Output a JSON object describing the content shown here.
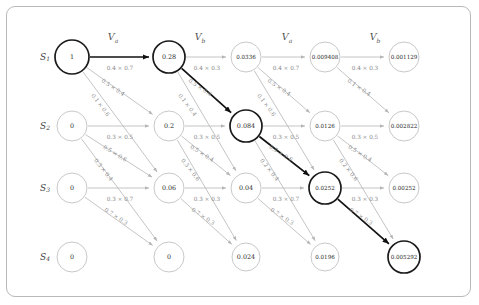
{
  "diagram": {
    "geometry": {
      "col_x": [
        72,
        169,
        246,
        325,
        404,
        443
      ],
      "row_y": [
        57,
        126,
        188,
        257
      ],
      "radius_big": 17,
      "radius": 15,
      "radius_small": 13
    },
    "state_labels": [
      {
        "base": "S",
        "sub": "1",
        "x": 45,
        "y": 57
      },
      {
        "base": "S",
        "sub": "2",
        "x": 45,
        "y": 126
      },
      {
        "base": "S",
        "sub": "3",
        "x": 45,
        "y": 188
      },
      {
        "base": "S",
        "sub": "4",
        "x": 45,
        "y": 257
      }
    ],
    "column_labels": [
      {
        "base": "V",
        "sub": "a",
        "x": 113,
        "y": 40
      },
      {
        "base": "V",
        "sub": "b",
        "x": 200,
        "y": 40
      },
      {
        "base": "V",
        "sub": "a",
        "x": 287,
        "y": 40
      },
      {
        "base": "V",
        "sub": "b",
        "x": 375,
        "y": 40
      }
    ],
    "nodes": [
      {
        "id": "n00",
        "col": 0,
        "row": 0,
        "value": "1",
        "highlight": true,
        "r": 17
      },
      {
        "id": "n01",
        "col": 0,
        "row": 1,
        "value": "0",
        "highlight": false,
        "r": 15
      },
      {
        "id": "n02",
        "col": 0,
        "row": 2,
        "value": "0",
        "highlight": false,
        "r": 15
      },
      {
        "id": "n03",
        "col": 0,
        "row": 3,
        "value": "0",
        "highlight": false,
        "r": 15
      },
      {
        "id": "n10",
        "col": 1,
        "row": 0,
        "value": "0.28",
        "highlight": true,
        "r": 16
      },
      {
        "id": "n11",
        "col": 1,
        "row": 1,
        "value": "0.2",
        "highlight": false,
        "r": 15
      },
      {
        "id": "n12",
        "col": 1,
        "row": 2,
        "value": "0.06",
        "highlight": false,
        "r": 15
      },
      {
        "id": "n13",
        "col": 1,
        "row": 3,
        "value": "0",
        "highlight": false,
        "r": 15
      },
      {
        "id": "n20",
        "col": 2,
        "row": 0,
        "value": "0.0336",
        "highlight": false,
        "r": 15
      },
      {
        "id": "n21",
        "col": 2,
        "row": 1,
        "value": "0.084",
        "highlight": true,
        "r": 16
      },
      {
        "id": "n22",
        "col": 2,
        "row": 2,
        "value": "0.04",
        "highlight": false,
        "r": 15
      },
      {
        "id": "n23",
        "col": 2,
        "row": 3,
        "value": "0.024",
        "highlight": false,
        "r": 14
      },
      {
        "id": "n30",
        "col": 3,
        "row": 0,
        "value": "0.009408",
        "highlight": false,
        "r": 15
      },
      {
        "id": "n31",
        "col": 3,
        "row": 1,
        "value": "0.0126",
        "highlight": false,
        "r": 15
      },
      {
        "id": "n32",
        "col": 3,
        "row": 2,
        "value": "0.0252",
        "highlight": true,
        "r": 16
      },
      {
        "id": "n33",
        "col": 3,
        "row": 3,
        "value": "0.0196",
        "highlight": false,
        "r": 14
      },
      {
        "id": "n40",
        "col": 4,
        "row": 0,
        "value": "0.001129",
        "highlight": false,
        "r": 15
      },
      {
        "id": "n41",
        "col": 4,
        "row": 1,
        "value": "0.002822",
        "highlight": false,
        "r": 15
      },
      {
        "id": "n42",
        "col": 4,
        "row": 2,
        "value": "0.00252",
        "highlight": false,
        "r": 15
      },
      {
        "id": "n43",
        "col": 4,
        "row": 3,
        "value": "0.005292",
        "highlight": true,
        "r": 16
      }
    ],
    "edges": [
      {
        "from": "n00",
        "to": "n10",
        "label": "0.4 × 0.7",
        "highlight": true,
        "lx": 120,
        "ly": 70,
        "rot": 0
      },
      {
        "from": "n00",
        "to": "n11",
        "label": "0.5 × 0.4",
        "highlight": false,
        "lx": 112,
        "ly": 89,
        "rot": 34
      },
      {
        "from": "n00",
        "to": "n12",
        "label": "0.1 × 0.6",
        "highlight": false,
        "lx": 99,
        "ly": 106,
        "rot": 53
      },
      {
        "from": "n01",
        "to": "n11",
        "label": "0.3 × 0.5",
        "highlight": false,
        "lx": 120,
        "ly": 139,
        "rot": 0
      },
      {
        "from": "n01",
        "to": "n12",
        "label": "0.5 × 0.6",
        "highlight": false,
        "lx": 114,
        "ly": 155,
        "rot": 32
      },
      {
        "from": "n01",
        "to": "n13",
        "label": "0.3 × 0.4",
        "highlight": false,
        "lx": 102,
        "ly": 171,
        "rot": 52
      },
      {
        "from": "n02",
        "to": "n12",
        "label": "0.3 × 0.7",
        "highlight": false,
        "lx": 120,
        "ly": 201,
        "rot": 0
      },
      {
        "from": "n02",
        "to": "n13",
        "label": "0.7 × 0.3",
        "highlight": false,
        "lx": 115,
        "ly": 218,
        "rot": 33
      },
      {
        "from": "n10",
        "to": "n20",
        "label": "0.4 × 0.3",
        "highlight": false,
        "lx": 207,
        "ly": 70,
        "rot": 0
      },
      {
        "from": "n10",
        "to": "n21",
        "label": "0.5 × 0.6",
        "highlight": true,
        "lx": 199,
        "ly": 89,
        "rot": 34
      },
      {
        "from": "n10",
        "to": "n22",
        "label": "0.1 × 0.4",
        "highlight": false,
        "lx": 186,
        "ly": 106,
        "rot": 53
      },
      {
        "from": "n11",
        "to": "n21",
        "label": "0.3 × 0.5",
        "highlight": false,
        "lx": 207,
        "ly": 139,
        "rot": 0
      },
      {
        "from": "n11",
        "to": "n22",
        "label": "0.5 × 0.4",
        "highlight": false,
        "lx": 201,
        "ly": 155,
        "rot": 32
      },
      {
        "from": "n11",
        "to": "n23",
        "label": "0.3 × 0.6",
        "highlight": false,
        "lx": 189,
        "ly": 171,
        "rot": 52
      },
      {
        "from": "n12",
        "to": "n22",
        "label": "0.3 × 0.3",
        "highlight": false,
        "lx": 207,
        "ly": 201,
        "rot": 0
      },
      {
        "from": "n12",
        "to": "n23",
        "label": "0.7 × 0.3",
        "highlight": false,
        "lx": 202,
        "ly": 218,
        "rot": 33
      },
      {
        "from": "n20",
        "to": "n30",
        "label": "0.4 × 0.7",
        "highlight": false,
        "lx": 286,
        "ly": 70,
        "rot": 0
      },
      {
        "from": "n20",
        "to": "n31",
        "label": "0.5 × 0.4",
        "highlight": false,
        "lx": 278,
        "ly": 89,
        "rot": 34
      },
      {
        "from": "n20",
        "to": "n32",
        "label": "0.1 × 0.6",
        "highlight": false,
        "lx": 265,
        "ly": 106,
        "rot": 53
      },
      {
        "from": "n21",
        "to": "n31",
        "label": "0.3 × 0.5",
        "highlight": false,
        "lx": 286,
        "ly": 139,
        "rot": 0
      },
      {
        "from": "n21",
        "to": "n32",
        "label": "0.5 × 0.6",
        "highlight": true,
        "lx": 280,
        "ly": 155,
        "rot": 32
      },
      {
        "from": "n21",
        "to": "n33",
        "label": "0.2 × 0.4",
        "highlight": false,
        "lx": 268,
        "ly": 171,
        "rot": 52
      },
      {
        "from": "n22",
        "to": "n32",
        "label": "0.3 × 0.7",
        "highlight": false,
        "lx": 286,
        "ly": 201,
        "rot": 0
      },
      {
        "from": "n22",
        "to": "n33",
        "label": "0.7 × 0.3",
        "highlight": false,
        "lx": 281,
        "ly": 218,
        "rot": 33
      },
      {
        "from": "n30",
        "to": "n40",
        "label": "0.4 × 0.3",
        "highlight": false,
        "lx": 365,
        "ly": 70,
        "rot": 0
      },
      {
        "from": "n30",
        "to": "n41",
        "label": "0.1 × 0.4",
        "highlight": false,
        "lx": 358,
        "ly": 89,
        "rot": 34
      },
      {
        "from": "n31",
        "to": "n41",
        "label": "0.3 × 0.5",
        "highlight": false,
        "lx": 365,
        "ly": 139,
        "rot": 0
      },
      {
        "from": "n31",
        "to": "n42",
        "label": "0.5 × 0.4",
        "highlight": false,
        "lx": 359,
        "ly": 155,
        "rot": 32
      },
      {
        "from": "n31",
        "to": "n43",
        "label": "0.2 × 0.6",
        "highlight": false,
        "lx": 347,
        "ly": 171,
        "rot": 52
      },
      {
        "from": "n32",
        "to": "n42",
        "label": "0.3 × 0.3",
        "highlight": false,
        "lx": 365,
        "ly": 201,
        "rot": 0
      },
      {
        "from": "n32",
        "to": "n43",
        "label": "0.7 × 0.3",
        "highlight": true,
        "lx": 360,
        "ly": 218,
        "rot": 33
      }
    ]
  }
}
